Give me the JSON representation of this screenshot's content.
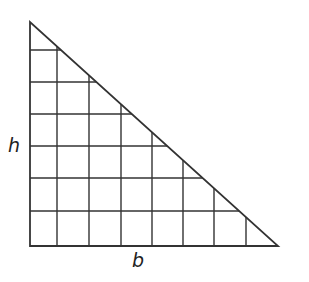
{
  "diagram": {
    "type": "right-triangle-on-grid",
    "labels": {
      "height": "h",
      "base": "b"
    },
    "colors": {
      "line": "#333333",
      "background": "#ffffff"
    },
    "triangle": {
      "top_vertex": [
        30,
        22
      ],
      "right_angle_vertex": [
        30,
        246
      ],
      "right_vertex": [
        278,
        246
      ]
    },
    "grid": {
      "columns": 8,
      "rows": 7,
      "vertical_lines_x": [
        57,
        89,
        121,
        152,
        183,
        214,
        246
      ],
      "horizontal_lines_y": [
        50,
        82,
        114,
        146,
        178,
        211
      ]
    }
  }
}
